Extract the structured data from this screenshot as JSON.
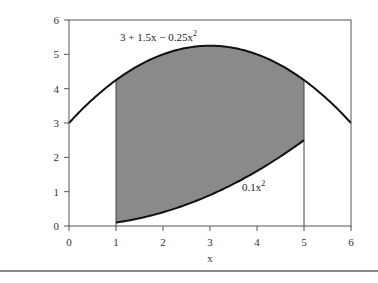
{
  "chart_data": {
    "type": "area",
    "title": "",
    "xlabel": "x",
    "ylabel": "",
    "xlim": [
      0,
      6
    ],
    "ylim": [
      0,
      6
    ],
    "xticks": [
      0,
      1,
      2,
      3,
      4,
      5,
      6
    ],
    "yticks": [
      0,
      1,
      2,
      3,
      4,
      5,
      6
    ],
    "grid": false,
    "legend": "none",
    "series": [
      {
        "name": "3 + 1.5x − 0.25x²",
        "label_main": "3 + 1.5x − 0.25x",
        "label_sup": "2",
        "formula": "3 + 1.5*x - 0.25*x^2",
        "x": [
          0,
          0.5,
          1,
          1.5,
          2,
          2.5,
          3,
          3.5,
          4,
          4.5,
          5,
          5.5,
          6
        ],
        "values": [
          3.0,
          3.6875,
          4.25,
          4.6875,
          5.0,
          5.1875,
          5.25,
          5.1875,
          5.0,
          4.6875,
          4.25,
          3.6875,
          3.0
        ]
      },
      {
        "name": "0.1x²",
        "label_main": "0.1x",
        "label_sup": "2",
        "formula": "0.1*x^2",
        "x": [
          1,
          1.5,
          2,
          2.5,
          3,
          3.5,
          4,
          4.5,
          5
        ],
        "values": [
          0.1,
          0.225,
          0.4,
          0.625,
          0.9,
          1.225,
          1.6,
          2.025,
          2.5
        ]
      }
    ],
    "shaded_region": {
      "between": [
        "3 + 1.5x − 0.25x²",
        "0.1x²"
      ],
      "x_from": 1,
      "x_to": 5,
      "color": "#8a8a8a"
    },
    "annotations": [
      {
        "text": "3 + 1.5x − 0.25x²",
        "near_x": 1.1,
        "near_y": 5.4
      },
      {
        "text": "0.1x²",
        "near_x": 3.7,
        "near_y": 1.0
      }
    ],
    "vertical_lines": [
      1,
      5
    ]
  },
  "colors": {
    "curve": "#111111",
    "fill": "#8a8a8a",
    "frame": "#555555"
  }
}
